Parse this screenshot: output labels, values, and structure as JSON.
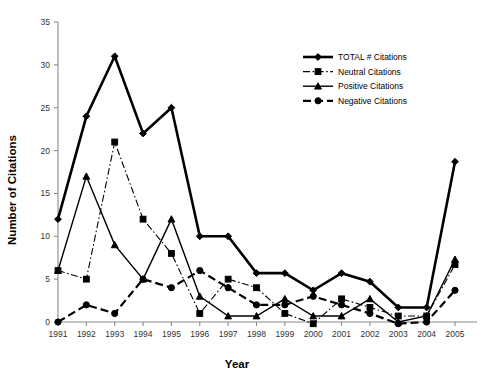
{
  "chart_data": {
    "type": "line",
    "title": "",
    "xlabel": "Year",
    "ylabel": "Number of Citations",
    "categories": [
      "1991",
      "1992",
      "1993",
      "1994",
      "1995",
      "1996",
      "1997",
      "1998",
      "1999",
      "2000",
      "2001",
      "2002",
      "2003",
      "2004",
      "2005"
    ],
    "x": [
      1991,
      1992,
      1993,
      1994,
      1995,
      1996,
      1997,
      1998,
      1999,
      2000,
      2001,
      2002,
      2003,
      2004,
      2005
    ],
    "xlim": [
      1991,
      2005
    ],
    "ylim": [
      0,
      35
    ],
    "yticks": [
      0,
      5,
      10,
      15,
      20,
      25,
      30,
      35
    ],
    "ytick_labels": [
      "0",
      "5",
      "10",
      "15",
      "20",
      "25",
      "30",
      "35"
    ],
    "grid": false,
    "legend_position": "upper-right",
    "series": [
      {
        "name": "TOTAL # Citations",
        "marker": "diamond",
        "linestyle": "solid",
        "linewidth": 2.6,
        "values": [
          12,
          24,
          31,
          22,
          25,
          10,
          10,
          5.7,
          5.7,
          3.7,
          5.7,
          4.7,
          1.7,
          1.7,
          18.7
        ]
      },
      {
        "name": "Neutral Citations",
        "marker": "square",
        "linestyle": "dashdot",
        "linewidth": 1.1,
        "values": [
          6,
          5,
          21,
          12,
          8,
          1,
          5,
          4,
          1,
          -0.2,
          2.7,
          1.7,
          0.7,
          0.7,
          6.7
        ]
      },
      {
        "name": "Positive Citations",
        "marker": "triangle",
        "linestyle": "solid",
        "linewidth": 1.4,
        "values": [
          6,
          17,
          9,
          5,
          12,
          3,
          0.7,
          0.7,
          2.7,
          0.7,
          0.7,
          2.7,
          0,
          0.7,
          7.3
        ]
      },
      {
        "name": "Negative Citations",
        "marker": "circle",
        "linestyle": "longdash",
        "linewidth": 2.2,
        "values": [
          0,
          2,
          1,
          5,
          4,
          6,
          4,
          2,
          2,
          3,
          2,
          1,
          -0.2,
          0,
          3.7
        ]
      }
    ]
  },
  "legend": {
    "items": [
      {
        "label": "TOTAL # Citations",
        "marker": "diamond-marker"
      },
      {
        "label": "Neutral Citations",
        "marker": "square-marker"
      },
      {
        "label": "Positive Citations",
        "marker": "triangle-marker"
      },
      {
        "label": "Negative Citations",
        "marker": "circle-marker"
      }
    ]
  },
  "axes": {
    "x_title": "Year",
    "y_title": "Number of Citations"
  },
  "colors": {
    "foreground": "#000000",
    "axis": "#8a8a8a",
    "background": "#ffffff"
  }
}
